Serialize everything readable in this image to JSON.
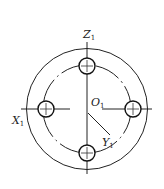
{
  "diagram": {
    "type": "flange-bolt-hole-pattern",
    "colors": {
      "stroke": "#222222",
      "background": "#ffffff"
    },
    "center": {
      "x": 87,
      "y": 109
    },
    "outer_circle_radius": 60,
    "bolt_circle_radius": 44,
    "hole_radius": 8,
    "holes": [
      {
        "name": "top",
        "x": 87,
        "y": 66
      },
      {
        "name": "right",
        "x": 133,
        "y": 109
      },
      {
        "name": "bottom",
        "x": 87,
        "y": 153
      },
      {
        "name": "left",
        "x": 46,
        "y": 109
      }
    ],
    "labels": {
      "z_axis": {
        "letter": "Z",
        "sub": "1"
      },
      "x_axis": {
        "letter": "X",
        "sub": "1"
      },
      "y_axis": {
        "letter": "Y",
        "sub": "1"
      },
      "origin": {
        "letter": "O",
        "sub": "1"
      }
    }
  }
}
